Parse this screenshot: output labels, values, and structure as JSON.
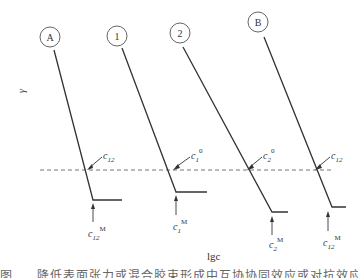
{
  "diagram": {
    "y_axis_label": "γ",
    "x_axis_label": "lgc",
    "curves": [
      {
        "id": "A",
        "label": "A",
        "cross_label": "c",
        "cross_sub": "12",
        "cross_sup": "",
        "cmc_label": "c",
        "cmc_sub": "12",
        "cmc_sup": "M"
      },
      {
        "id": "1",
        "label": "1",
        "cross_label": "c",
        "cross_sub": "1",
        "cross_sup": "0",
        "cmc_label": "c",
        "cmc_sub": "1",
        "cmc_sup": "M"
      },
      {
        "id": "2",
        "label": "2",
        "cross_label": "c",
        "cross_sub": "2",
        "cross_sup": "0",
        "cmc_label": "c",
        "cmc_sub": "2",
        "cmc_sup": "M"
      },
      {
        "id": "B",
        "label": "B",
        "cross_label": "c",
        "cross_sub": "12",
        "cross_sup": "",
        "cmc_label": "c",
        "cmc_sub": "12",
        "cmc_sup": "M"
      }
    ],
    "reference_line": "dashed horizontal (constant γ)",
    "caption": "图 ... 降低表面张力或混合胶束形成中互协协同效应或对抗效应（条件"
  }
}
